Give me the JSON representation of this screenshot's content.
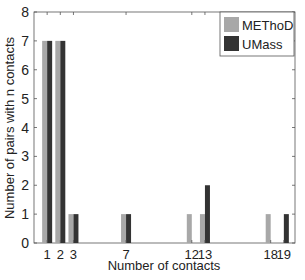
{
  "chart_data": {
    "type": "bar",
    "title": "",
    "xlabel": "Number of contacts",
    "ylabel": "Number of pairs with n contacts",
    "categories": [
      1,
      2,
      3,
      7,
      12,
      13,
      18,
      19
    ],
    "series": [
      {
        "name": "METhoD",
        "color": "#a8a8a8",
        "values": [
          7,
          7,
          1,
          1,
          1,
          1,
          1,
          0
        ]
      },
      {
        "name": "UMass",
        "color": "#333333",
        "values": [
          7,
          7,
          1,
          1,
          0,
          2,
          0,
          1
        ]
      }
    ],
    "xlim": [
      0,
      20
    ],
    "ylim": [
      0,
      8
    ],
    "xticks": [
      1,
      2,
      3,
      7,
      12,
      13,
      18,
      19
    ],
    "xtick_labels": [
      "1",
      "2",
      "3",
      "7",
      "12",
      "13",
      "18",
      "19"
    ],
    "yticks": [
      0,
      1,
      2,
      3,
      4,
      5,
      6,
      7,
      8
    ],
    "grid": false,
    "legend_position": "upper right"
  }
}
